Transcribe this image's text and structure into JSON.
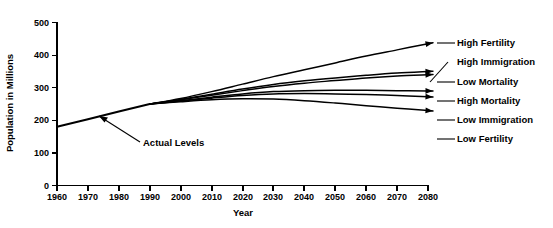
{
  "chart_data": {
    "type": "line",
    "title": "",
    "xlabel": "Year",
    "ylabel": "Population in Millions",
    "xlim": [
      1960,
      2080
    ],
    "ylim": [
      0,
      500
    ],
    "grid": false,
    "legend_position": "right-inline-labels",
    "xticks": [
      1960,
      1970,
      1980,
      1990,
      2000,
      2010,
      2020,
      2030,
      2040,
      2050,
      2060,
      2070,
      2080
    ],
    "xticklabels": [
      "1960",
      "1970",
      "1980",
      "1990",
      "2000",
      "2010",
      "2020",
      "2030",
      "2040",
      "2050",
      "2060",
      "2070",
      "2080"
    ],
    "yticks": [
      0,
      100,
      200,
      300,
      400,
      500
    ],
    "yticklabels": [
      "0",
      "100",
      "200",
      "300",
      "400",
      "500"
    ],
    "annotations": [
      {
        "text": "Actual Levels",
        "points_to_year": 1973,
        "points_to_value": 212
      }
    ],
    "x": [
      1990,
      2000,
      2010,
      2020,
      2030,
      2040,
      2050,
      2060,
      2070,
      2080
    ],
    "series": [
      {
        "name": "Actual Levels",
        "x": [
          1960,
          1970,
          1980,
          1990
        ],
        "values": [
          180,
          203,
          227,
          250
        ],
        "historical": true
      },
      {
        "name": "High Fertility",
        "values": [
          250,
          267,
          288,
          311,
          334,
          355,
          376,
          397,
          416,
          435
        ]
      },
      {
        "name": "High Immigration",
        "values": [
          250,
          264,
          280,
          296,
          310,
          321,
          330,
          338,
          345,
          350
        ]
      },
      {
        "name": "Low Mortality",
        "values": [
          250,
          263,
          277,
          291,
          304,
          314,
          322,
          330,
          336,
          340
        ]
      },
      {
        "name": "High Mortality",
        "values": [
          250,
          260,
          271,
          281,
          288,
          291,
          292,
          292,
          291,
          290
        ]
      },
      {
        "name": "Low Immigration",
        "values": [
          250,
          259,
          268,
          276,
          281,
          282,
          281,
          279,
          276,
          272
        ]
      },
      {
        "name": "Low Fertility",
        "values": [
          250,
          257,
          263,
          266,
          265,
          260,
          253,
          245,
          237,
          230
        ]
      }
    ]
  },
  "labels": {
    "high_fertility": "High Fertility",
    "high_immigration": "High Immigration",
    "low_mortality": "Low Mortality",
    "high_mortality": "High Mortality",
    "low_immigration": "Low Immigration",
    "low_fertility": "Low Fertility",
    "actual_levels": "Actual Levels"
  }
}
